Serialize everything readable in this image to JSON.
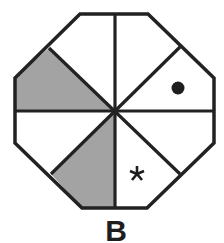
{
  "figure": {
    "label": "B",
    "shape": "octagon",
    "sectors": 8,
    "colors": {
      "stroke": "#222222",
      "shaded": "#a3a3a3",
      "background": "#ffffff"
    },
    "shaded_sectors": [
      "left-upper",
      "bottom-left"
    ],
    "markers": [
      {
        "type": "dot",
        "sector": "right-upper",
        "symbol": "●"
      },
      {
        "type": "asterisk",
        "sector": "bottom-right",
        "symbol": "*"
      }
    ]
  }
}
